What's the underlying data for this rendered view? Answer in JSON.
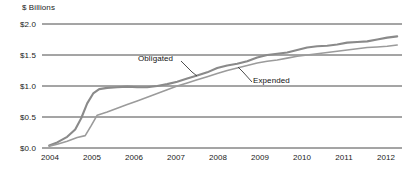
{
  "chart_data": {
    "type": "line",
    "title": "",
    "ylabel": "$ Billions",
    "xlabel": "",
    "ylim": [
      0.0,
      2.0
    ],
    "ytick_labels": [
      "$2.0",
      "$1.5",
      "$1.0",
      "$0.5",
      "$0.0"
    ],
    "ytick_values": [
      2.0,
      1.5,
      1.0,
      0.5,
      0.0
    ],
    "grid": true,
    "legend_position": "inline-annotations",
    "categories": [
      "2004",
      "2005",
      "2006",
      "2007",
      "2008",
      "2009",
      "2010",
      "2011",
      "2012"
    ],
    "xtick_labels": [
      "2004",
      "2005",
      "2006",
      "2007",
      "2008",
      "2009",
      "2010",
      "2011",
      "2012"
    ],
    "series": [
      {
        "name": "Obligated",
        "color": "#8a8a8a",
        "x": [
          2003.8,
          2004.0,
          2004.25,
          2004.45,
          2004.6,
          2004.75,
          2004.9,
          2005.05,
          2005.25,
          2005.5,
          2005.75,
          2006.0,
          2006.25,
          2006.5,
          2006.75,
          2007.0,
          2007.25,
          2007.5,
          2007.75,
          2008.0,
          2008.25,
          2008.5,
          2008.75,
          2009.0,
          2009.25,
          2009.5,
          2009.75,
          2010.0,
          2010.25,
          2010.5,
          2010.75,
          2011.0,
          2011.25,
          2011.5,
          2011.75,
          2012.0,
          2012.25,
          2012.5
        ],
        "values": [
          0.04,
          0.09,
          0.18,
          0.3,
          0.48,
          0.72,
          0.88,
          0.95,
          0.97,
          0.98,
          0.99,
          0.98,
          0.98,
          1.0,
          1.03,
          1.07,
          1.12,
          1.17,
          1.22,
          1.29,
          1.33,
          1.36,
          1.4,
          1.46,
          1.5,
          1.52,
          1.54,
          1.58,
          1.62,
          1.64,
          1.65,
          1.67,
          1.7,
          1.71,
          1.72,
          1.75,
          1.78,
          1.8
        ],
        "end_value": 1.8
      },
      {
        "name": "Expended",
        "color": "#9b9b9b",
        "x": [
          2003.8,
          2004.0,
          2004.25,
          2004.5,
          2004.7,
          2004.85,
          2005.0,
          2005.25,
          2005.5,
          2005.75,
          2006.0,
          2006.25,
          2006.5,
          2006.75,
          2007.0,
          2007.25,
          2007.5,
          2007.75,
          2008.0,
          2008.25,
          2008.5,
          2008.75,
          2009.0,
          2009.25,
          2009.5,
          2009.75,
          2010.0,
          2010.25,
          2010.5,
          2010.75,
          2011.0,
          2011.25,
          2011.5,
          2011.75,
          2012.0,
          2012.25,
          2012.5
        ],
        "values": [
          0.03,
          0.06,
          0.11,
          0.17,
          0.2,
          0.36,
          0.53,
          0.58,
          0.64,
          0.7,
          0.76,
          0.82,
          0.88,
          0.94,
          1.0,
          1.05,
          1.1,
          1.15,
          1.2,
          1.25,
          1.29,
          1.33,
          1.37,
          1.4,
          1.42,
          1.45,
          1.48,
          1.5,
          1.52,
          1.54,
          1.56,
          1.58,
          1.6,
          1.62,
          1.63,
          1.64,
          1.66
        ],
        "end_value": 1.66
      }
    ],
    "annotations": [
      {
        "text": "Obligated",
        "label_x": 138,
        "label_y": 55
      },
      {
        "text": "Expended",
        "label_x": 253,
        "label_y": 77
      }
    ]
  }
}
